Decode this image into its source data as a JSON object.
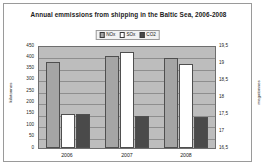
{
  "chart_data": {
    "type": "bar",
    "title": "Annual emmissions from shipping in the Baltic Sea, 2006-2008",
    "categories": [
      "2006",
      "2007",
      "2008"
    ],
    "series": [
      {
        "name": "NOx",
        "values": [
          375,
          400,
          395
        ],
        "color": "#a5a5a5",
        "axis": "left"
      },
      {
        "name": "SOx",
        "values": [
          150,
          420,
          365
        ],
        "color": "#ffffff",
        "axis": "left"
      },
      {
        "name": "CO2",
        "values": [
          150,
          140,
          135
        ],
        "color": "#4a4a4a",
        "axis": "right"
      }
    ],
    "xlabel": "",
    "ylabel": "kilotonnes",
    "ylabel_right": "megatonnes",
    "ylim": [
      0,
      450
    ],
    "ylim_right": [
      16.5,
      19.5
    ],
    "yticks": [
      "450",
      "400",
      "350",
      "300",
      "250",
      "200",
      "150",
      "100",
      "50",
      "0"
    ],
    "yticks_right": [
      "19,5",
      "19",
      "18,5",
      "18",
      "17,5",
      "17",
      "16,5"
    ],
    "grid": true,
    "legend_position": "top-center"
  }
}
